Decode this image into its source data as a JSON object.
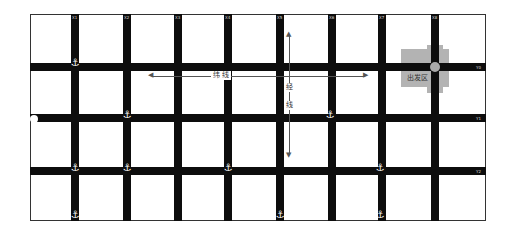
{
  "diagram": {
    "frame": {
      "left": 30,
      "top": 14,
      "right": 486,
      "bottom": 221
    },
    "vertical_lines": [
      {
        "x": 75,
        "tag": "X1"
      },
      {
        "x": 127,
        "tag": "X2"
      },
      {
        "x": 178,
        "tag": "X3"
      },
      {
        "x": 228,
        "tag": "X4"
      },
      {
        "x": 280,
        "tag": "X5"
      },
      {
        "x": 332,
        "tag": "X6"
      },
      {
        "x": 382,
        "tag": "X7"
      },
      {
        "x": 435,
        "tag": "X8"
      }
    ],
    "horizontal_lines": [
      {
        "y": 67,
        "tag": "Y0"
      },
      {
        "y": 118,
        "tag": "Y1"
      },
      {
        "y": 171,
        "tag": "Y2"
      }
    ],
    "anchors": [
      {
        "x": 75,
        "y": 63
      },
      {
        "x": 127,
        "y": 115
      },
      {
        "x": 330,
        "y": 115
      },
      {
        "x": 75,
        "y": 168
      },
      {
        "x": 127,
        "y": 168
      },
      {
        "x": 228,
        "y": 168
      },
      {
        "x": 380,
        "y": 168
      },
      {
        "x": 75,
        "y": 215
      },
      {
        "x": 280,
        "y": 215
      },
      {
        "x": 380,
        "y": 215
      }
    ],
    "start_dot": {
      "x": 34,
      "y": 119
    },
    "departure_zone": {
      "label": "出发区",
      "color": "#b3b3b3",
      "center_x": 435,
      "center_y": 67
    },
    "latitude_arrow": {
      "label": "纬 线",
      "x1": 152,
      "x2": 365,
      "y": 76
    },
    "longitude_arrow": {
      "label_1": "经",
      "label_2": "线",
      "x": 289,
      "y1": 35,
      "y2": 155
    },
    "colors": {
      "road": "#0d0d0d",
      "frame": "#333333",
      "zone": "#b3b3b3",
      "background": "#ffffff"
    }
  }
}
